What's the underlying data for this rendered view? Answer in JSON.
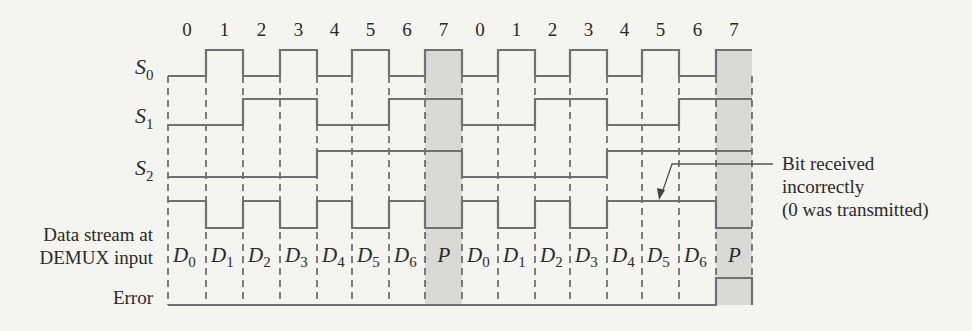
{
  "diagram": {
    "colors": {
      "background": "#f4f4f1",
      "wave": "#707070",
      "grid": "#4a4a4a",
      "shade": "#d9d9d7",
      "text": "#2a2a2a"
    },
    "geometry": {
      "boundaries_x": [
        168,
        206,
        243,
        280,
        317,
        352,
        389,
        425,
        462,
        498,
        535,
        570,
        607,
        642,
        679,
        716,
        752
      ],
      "grid_top": 76,
      "grid_bottom": 305,
      "shaded_slots": [
        7,
        15
      ],
      "shade_top": 50
    },
    "slot_numbers": {
      "y": 36,
      "labels": [
        "0",
        "1",
        "2",
        "3",
        "4",
        "5",
        "6",
        "7",
        "0",
        "1",
        "2",
        "3",
        "4",
        "5",
        "6",
        "7"
      ]
    },
    "signals": [
      {
        "id": "S0",
        "label_main": "S",
        "label_sub": "0",
        "label_x": 135,
        "label_y": 76,
        "high_y": 50,
        "low_y": 76,
        "bits": [
          0,
          1,
          0,
          1,
          0,
          1,
          0,
          1,
          0,
          1,
          0,
          1,
          0,
          1,
          0,
          1
        ]
      },
      {
        "id": "S1",
        "label_main": "S",
        "label_sub": "1",
        "label_x": 135,
        "label_y": 125,
        "high_y": 99,
        "low_y": 125,
        "bits": [
          0,
          0,
          1,
          1,
          0,
          0,
          1,
          1,
          0,
          0,
          1,
          1,
          0,
          0,
          1,
          1
        ]
      },
      {
        "id": "S2",
        "label_main": "S",
        "label_sub": "2",
        "label_x": 135,
        "label_y": 177,
        "high_y": 151,
        "low_y": 177,
        "bits": [
          0,
          0,
          0,
          0,
          1,
          1,
          1,
          1,
          0,
          0,
          0,
          0,
          1,
          1,
          1,
          1
        ]
      },
      {
        "id": "data",
        "high_y": 201,
        "low_y": 228,
        "bits": [
          1,
          0,
          1,
          0,
          1,
          0,
          1,
          0,
          1,
          0,
          1,
          0,
          1,
          1,
          1,
          0
        ]
      },
      {
        "id": "error",
        "high_y": 278,
        "low_y": 305,
        "bits": [
          0,
          0,
          0,
          0,
          0,
          0,
          0,
          0,
          0,
          0,
          0,
          0,
          0,
          0,
          0,
          1
        ]
      }
    ],
    "data_slot_labels": {
      "y": 262,
      "items": [
        {
          "main": "D",
          "sub": "0"
        },
        {
          "main": "D",
          "sub": "1"
        },
        {
          "main": "D",
          "sub": "2"
        },
        {
          "main": "D",
          "sub": "3"
        },
        {
          "main": "D",
          "sub": "4"
        },
        {
          "main": "D",
          "sub": "5"
        },
        {
          "main": "D",
          "sub": "6"
        },
        {
          "main": "P",
          "sub": ""
        },
        {
          "main": "D",
          "sub": "0"
        },
        {
          "main": "D",
          "sub": "1"
        },
        {
          "main": "D",
          "sub": "2"
        },
        {
          "main": "D",
          "sub": "3"
        },
        {
          "main": "D",
          "sub": "4"
        },
        {
          "main": "D",
          "sub": "5"
        },
        {
          "main": "D",
          "sub": "6"
        },
        {
          "main": "P",
          "sub": ""
        }
      ]
    },
    "row_labels": {
      "data_line1": "Data stream at",
      "data_line2": "DEMUX input",
      "error": "Error"
    },
    "annotation": {
      "line1": "Bit received",
      "line2": "incorrectly",
      "line3": "(0 was transmitted)",
      "leader_points": "773,164 672,164 662,193",
      "arrow_tip": [
        659,
        200
      ]
    }
  }
}
